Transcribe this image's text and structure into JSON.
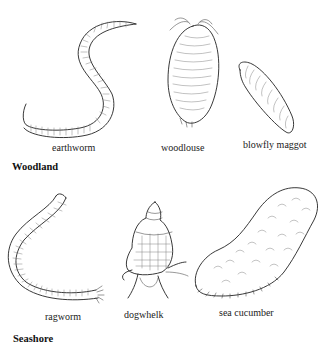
{
  "figure": {
    "sections": [
      {
        "title": "Woodland",
        "animals": [
          {
            "name": "earthworm",
            "icon": "earthworm-illustration"
          },
          {
            "name": "woodlouse",
            "icon": "woodlouse-illustration"
          },
          {
            "name": "blowfly maggot",
            "icon": "blowfly-maggot-illustration"
          }
        ]
      },
      {
        "title": "Seashore",
        "animals": [
          {
            "name": "ragworm",
            "icon": "ragworm-illustration"
          },
          {
            "name": "dogwhelk",
            "icon": "dogwhelk-illustration"
          },
          {
            "name": "sea cucumber",
            "icon": "sea-cucumber-illustration"
          }
        ]
      }
    ]
  }
}
